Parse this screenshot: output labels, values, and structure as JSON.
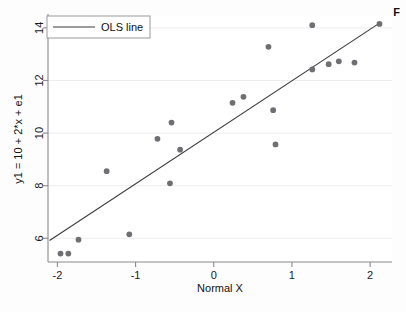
{
  "figure": {
    "corner_label": "F",
    "background_color": "#fdfdfd",
    "plot_area_color": "#ffffff"
  },
  "chart_data": {
    "type": "scatter",
    "title": "",
    "subtitle": "",
    "xlabel": "Normal X",
    "ylabel": "y1 = 10 + 2*x + e1",
    "xlim": [
      -2.12,
      2.28
    ],
    "ylim": [
      5.1,
      14.45
    ],
    "xticks": [
      -2,
      -1,
      0,
      1,
      2
    ],
    "xticklabels": [
      "-2",
      "-1",
      "0",
      "1",
      "2"
    ],
    "yticks": [
      6,
      8,
      10,
      12,
      14
    ],
    "yticklabels": [
      "6",
      "8",
      "10",
      "12",
      "14"
    ],
    "grid": "horizontal-faint",
    "legend": {
      "position": "top-left",
      "entries": [
        {
          "label": "OLS line",
          "type": "line",
          "color": "#3a3a3a"
        }
      ]
    },
    "marker": {
      "shape": "circle",
      "color": "#6e6e73",
      "size": 4.6
    },
    "series": [
      {
        "name": "observations",
        "type": "scatter",
        "x": [
          -1.96,
          -1.86,
          -1.73,
          -1.37,
          -1.08,
          -0.72,
          -0.56,
          -0.54,
          -0.43,
          0.24,
          0.38,
          0.7,
          0.76,
          0.79,
          1.26,
          1.26,
          1.47,
          1.6,
          1.8,
          2.12
        ],
        "y": [
          5.42,
          5.42,
          5.95,
          8.55,
          6.15,
          9.78,
          8.09,
          10.4,
          9.37,
          11.15,
          11.38,
          13.28,
          10.87,
          9.57,
          14.1,
          12.42,
          12.62,
          12.73,
          12.68,
          14.15
        ]
      },
      {
        "name": "OLS line",
        "type": "line",
        "x": [
          -2.1,
          2.12
        ],
        "y": [
          5.92,
          14.18
        ],
        "color": "#3a3a3a",
        "width": 1.1
      }
    ]
  }
}
